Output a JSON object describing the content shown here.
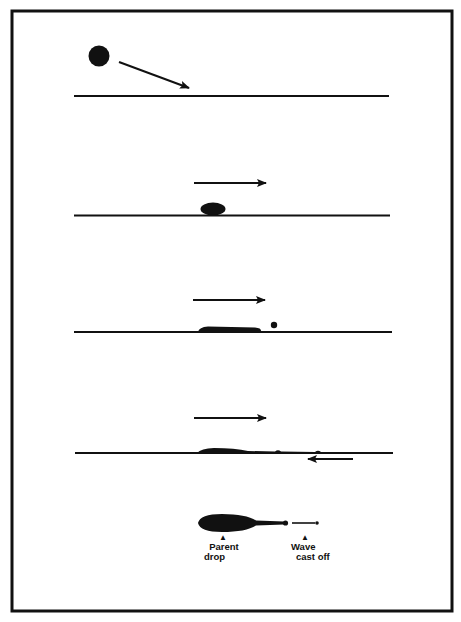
{
  "diagram": {
    "type": "process-sequence",
    "stages": [
      {
        "id": 1,
        "description": "Falling drop with oblique arrow toward surface"
      },
      {
        "id": 2,
        "description": "Drop lands on surface; surface motion arrow to right"
      },
      {
        "id": 3,
        "description": "Drop elongates along surface, small droplet ahead"
      },
      {
        "id": 4,
        "description": "Drop stretched with tail, opposing arrow beneath surface"
      },
      {
        "id": 5,
        "description": "Plan view of parent drop with wave cast off"
      }
    ],
    "labels": {
      "parent_line1": "Parent",
      "parent_line2": "drop",
      "wave_line1": "Wave",
      "wave_line2": "cast off",
      "caret": "▲"
    },
    "colors": {
      "ink": "#111111",
      "background": "#ffffff"
    }
  }
}
